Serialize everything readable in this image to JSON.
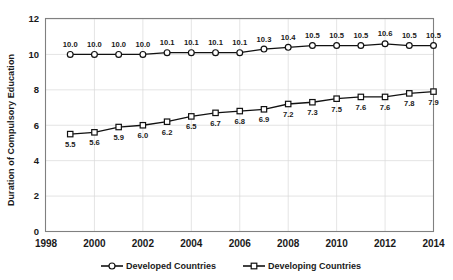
{
  "chart_data": {
    "type": "line",
    "title": "",
    "xlabel": "",
    "ylabel": "Duration of Compulsory Education",
    "x": [
      1999,
      2000,
      2001,
      2002,
      2003,
      2004,
      2005,
      2006,
      2007,
      2008,
      2009,
      2010,
      2011,
      2012,
      2013,
      2014
    ],
    "xlim": [
      1998,
      2014
    ],
    "ylim": [
      0,
      12
    ],
    "xticks": [
      1998,
      2000,
      2002,
      2004,
      2006,
      2008,
      2010,
      2012,
      2014
    ],
    "xtick_labels": [
      "1998",
      "2000",
      "2002",
      "2004",
      "2006",
      "2008",
      "2010",
      "2012",
      "2014"
    ],
    "yticks": [
      0,
      2,
      4,
      6,
      8,
      10,
      12
    ],
    "ytick_labels": [
      "0",
      "2",
      "4",
      "6",
      "8",
      "10",
      "12"
    ],
    "grid": "horizontal-and-vertical",
    "legend_position": "bottom",
    "series": [
      {
        "name": "Developed Countries",
        "marker": "circle",
        "color": "#111111",
        "values": [
          10.0,
          10.0,
          10.0,
          10.0,
          10.1,
          10.1,
          10.1,
          10.1,
          10.3,
          10.4,
          10.5,
          10.5,
          10.5,
          10.6,
          10.5,
          10.5
        ],
        "labels": [
          "10.0",
          "10.0",
          "10.0",
          "10.0",
          "10.1",
          "10.1",
          "10.1",
          "10.1",
          "10.3",
          "10.4",
          "10.5",
          "10.5",
          "10.5",
          "10.6",
          "10.5",
          "10.5"
        ],
        "label_position": "above"
      },
      {
        "name": "Developing Countries",
        "marker": "square",
        "color": "#111111",
        "values": [
          5.5,
          5.6,
          5.9,
          6.0,
          6.2,
          6.5,
          6.7,
          6.8,
          6.9,
          7.2,
          7.3,
          7.5,
          7.6,
          7.6,
          7.8,
          7.9
        ],
        "labels": [
          "5.5",
          "5.6",
          "5.9",
          "6.0",
          "6.2",
          "6.5",
          "6.7",
          "6.8",
          "6.9",
          "7.2",
          "7.3",
          "7.5",
          "7.6",
          "7.6",
          "7.8",
          "7.9"
        ],
        "label_position": "below"
      }
    ]
  },
  "legend": {
    "items": [
      {
        "label": "Developed Countries",
        "marker": "circle"
      },
      {
        "label": "Developing Countries",
        "marker": "square"
      }
    ]
  }
}
